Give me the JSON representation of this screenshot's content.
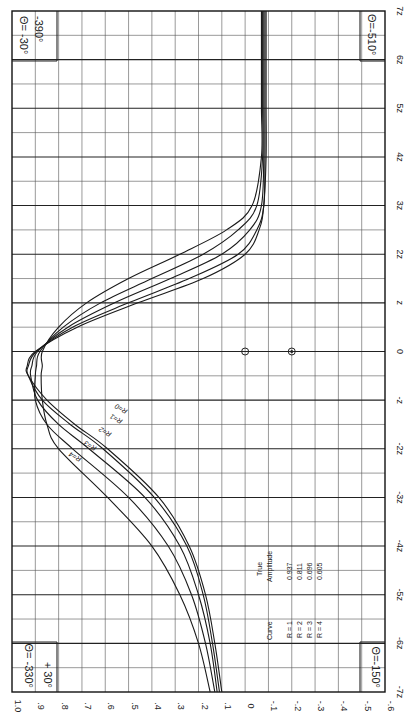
{
  "chart_data": {
    "type": "line",
    "orientation": "rotated-90-clockwise",
    "title": "",
    "xlabel": "z (distance, units of z)",
    "ylabel": "Amplitude",
    "x_ticks": [
      "-7z",
      "-6z",
      "-5z",
      "-4z",
      "-3z",
      "-2z",
      "-z",
      "0",
      "z",
      "2z",
      "3z",
      "4z",
      "5z",
      "6z",
      "7z"
    ],
    "y_ticks": [
      "1.0",
      ".9",
      ".8",
      ".7",
      ".6",
      ".5",
      ".4",
      ".3",
      ".2",
      ".1",
      "0",
      "-.1",
      "-.2",
      "-.3",
      "-.4",
      "-.5",
      "-.6"
    ],
    "xlim": [
      -7,
      7
    ],
    "ylim": [
      -0.6,
      1.0
    ],
    "grid": true,
    "corner_labels": {
      "top_left": "Θ= -30°",
      "top_left_2": "-390°",
      "top_right": "Θ=-510°",
      "bottom_left": "Θ= -330°",
      "bottom_left_2": "+ 30°",
      "bottom_right": "Θ=-150°"
    },
    "markers": [
      {
        "z": 0,
        "value": 0.0,
        "style": "open-circle"
      },
      {
        "z": 0,
        "value": -0.2,
        "style": "dotted-circle"
      }
    ],
    "x": [
      -7,
      -6,
      -5,
      -4,
      -3,
      -2,
      -1.5,
      -1,
      -0.5,
      -0.3,
      0,
      0.5,
      1,
      1.5,
      2,
      2.5,
      3,
      4,
      5,
      6,
      7
    ],
    "series": [
      {
        "name": "R = 0",
        "values": [
          0.1,
          0.13,
          0.17,
          0.24,
          0.37,
          0.59,
          0.73,
          0.85,
          0.93,
          0.935,
          0.9,
          0.72,
          0.46,
          0.18,
          0.0,
          -0.06,
          -0.08,
          -0.09,
          -0.09,
          -0.09,
          -0.09
        ]
      },
      {
        "name": "R = 1",
        "values": [
          0.11,
          0.14,
          0.18,
          0.25,
          0.39,
          0.61,
          0.75,
          0.87,
          0.93,
          0.93,
          0.895,
          0.74,
          0.5,
          0.24,
          0.03,
          -0.05,
          -0.08,
          -0.085,
          -0.085,
          -0.085,
          -0.085
        ]
      },
      {
        "name": "R = 2",
        "values": [
          0.12,
          0.15,
          0.2,
          0.28,
          0.43,
          0.67,
          0.8,
          0.89,
          0.92,
          0.915,
          0.89,
          0.76,
          0.56,
          0.32,
          0.1,
          -0.02,
          -0.07,
          -0.08,
          -0.08,
          -0.08,
          -0.08
        ]
      },
      {
        "name": "R = 3",
        "values": [
          0.13,
          0.17,
          0.23,
          0.33,
          0.5,
          0.74,
          0.85,
          0.9,
          0.9,
          0.895,
          0.88,
          0.78,
          0.62,
          0.4,
          0.18,
          0.03,
          -0.05,
          -0.075,
          -0.075,
          -0.075,
          -0.075
        ]
      },
      {
        "name": "R = 4",
        "values": [
          0.15,
          0.2,
          0.28,
          0.4,
          0.59,
          0.8,
          0.85,
          0.87,
          0.875,
          0.87,
          0.87,
          0.8,
          0.68,
          0.5,
          0.28,
          0.08,
          -0.03,
          -0.07,
          -0.07,
          -0.07,
          -0.07
        ]
      }
    ],
    "legend_table": {
      "headers": [
        "Curve",
        "True Amplitude"
      ],
      "rows": [
        {
          "curve": "R = 1",
          "amplitude": "0.937"
        },
        {
          "curve": "R = 2",
          "amplitude": "0.811"
        },
        {
          "curve": "R = 3",
          "amplitude": "0.696"
        },
        {
          "curve": "R = 4",
          "amplitude": "0.605"
        }
      ]
    }
  },
  "labels": {
    "legend_header_curve": "Curve",
    "legend_header_true": "True",
    "legend_header_amp": "Amplitude"
  }
}
